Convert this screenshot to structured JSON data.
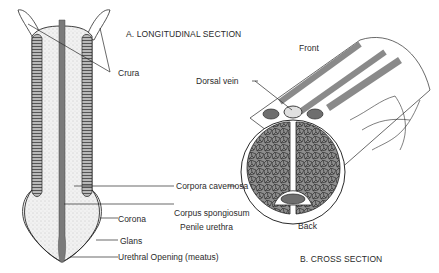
{
  "diagram": {
    "section_a": {
      "title": "A. LONGITUDINAL SECTION",
      "labels": {
        "crura": "Crura",
        "corpora_cavernosa": "Corpora cavernosa",
        "corpus_spongiosum": "Corpus spongiosum",
        "penile_urethra": "Penile urethra",
        "corona": "Corona",
        "glans": "Glans",
        "urethral_opening": "Urethral Opening (meatus)"
      }
    },
    "section_b": {
      "title": "B. CROSS SECTION",
      "labels": {
        "front": "Front",
        "dorsal_vein": "Dorsal vein",
        "back": "Back"
      }
    },
    "colors": {
      "tissue_fill": "#8c8c8c",
      "tissue_light": "#e9e9e9",
      "outline": "#2a2a2a",
      "urethra": "#7a7a7a"
    }
  }
}
